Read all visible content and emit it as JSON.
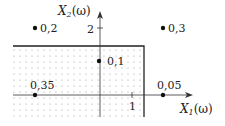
{
  "diagram": {
    "type": "probability-mass-distribution",
    "axes": {
      "x_label": "X",
      "x_sub": "1",
      "x_arg": "(ω)",
      "y_label": "X",
      "y_sub": "2",
      "y_arg": "(ω)",
      "x_tick": "1",
      "y_tick": "2"
    },
    "points": [
      {
        "label": "0,2",
        "x": -1,
        "y": 2
      },
      {
        "label": "0,3",
        "x": 2,
        "y": 2
      },
      {
        "label": "0,1",
        "x": 0,
        "y": 1
      },
      {
        "label": "0,35",
        "x": -1,
        "y": 0
      },
      {
        "label": "0,05",
        "x": 2,
        "y": 0
      }
    ],
    "shaded_region": "{X1 < 1.3, X2 < 1.8} (dotted)",
    "colors": {
      "ink": "#222222",
      "dots": "#9a9a9a",
      "background": "#ffffff"
    }
  }
}
